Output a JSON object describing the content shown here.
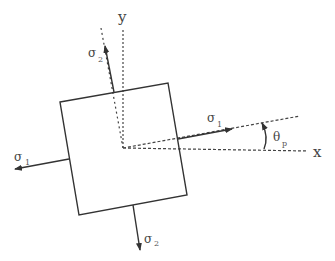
{
  "diagram": {
    "axes": {
      "x_label": "x",
      "y_label": "y"
    },
    "angle": {
      "symbol": "θ",
      "subscript": "p"
    },
    "stresses": {
      "sigma1_right": {
        "symbol": "σ",
        "subscript": "1"
      },
      "sigma1_left": {
        "symbol": "σ",
        "subscript": "1"
      },
      "sigma2_top": {
        "symbol": "σ",
        "subscript": "2"
      },
      "sigma2_bottom": {
        "symbol": "σ",
        "subscript": "2"
      }
    },
    "colors": {
      "stroke": "#333333",
      "text": "#444444"
    }
  }
}
